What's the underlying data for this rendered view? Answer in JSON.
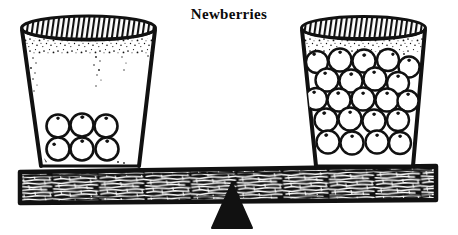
{
  "title": "Newberries",
  "illustration": {
    "kind": "balance-scale-line-drawing",
    "style": "black-and-white pen-and-ink hatching",
    "background_color": "#ffffff",
    "ink_color": "#111111",
    "fulcrum": {
      "label": "fulcrum",
      "shape": "triangle",
      "fill_color": "#111111"
    },
    "plank": {
      "label": "plank",
      "texture": "wood-grain hatching",
      "outline_color": "#111111",
      "tilt": "level"
    },
    "left_glass": {
      "label": "Left glass",
      "berry_count": 6,
      "berry_rows": [
        3,
        3
      ],
      "fill_description": "six berries resting on the bottom",
      "rim_texture": "hatched ellipse rim with speckled band"
    },
    "right_glass": {
      "label": "Right glass",
      "berry_count": 22,
      "berry_rows": [
        4,
        5,
        4,
        5,
        4
      ],
      "fill_description": "glass packed full of berries to the rim",
      "rim_texture": "hatched ellipse rim with speckled band"
    }
  }
}
